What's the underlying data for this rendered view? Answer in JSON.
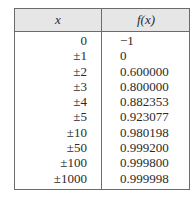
{
  "table": {
    "headers": {
      "x": "x",
      "fx": "f(x)"
    },
    "rows": [
      {
        "x": "0",
        "fx": "−1"
      },
      {
        "x": "±1",
        "fx": "0"
      },
      {
        "x": "±2",
        "fx": "0.600000"
      },
      {
        "x": "±3",
        "fx": "0.800000"
      },
      {
        "x": "±4",
        "fx": "0.882353"
      },
      {
        "x": "±5",
        "fx": "0.923077"
      },
      {
        "x": "±10",
        "fx": "0.980198"
      },
      {
        "x": "±50",
        "fx": "0.999200"
      },
      {
        "x": "±100",
        "fx": "0.999800"
      },
      {
        "x": "±1000",
        "fx": "0.999998"
      }
    ]
  }
}
